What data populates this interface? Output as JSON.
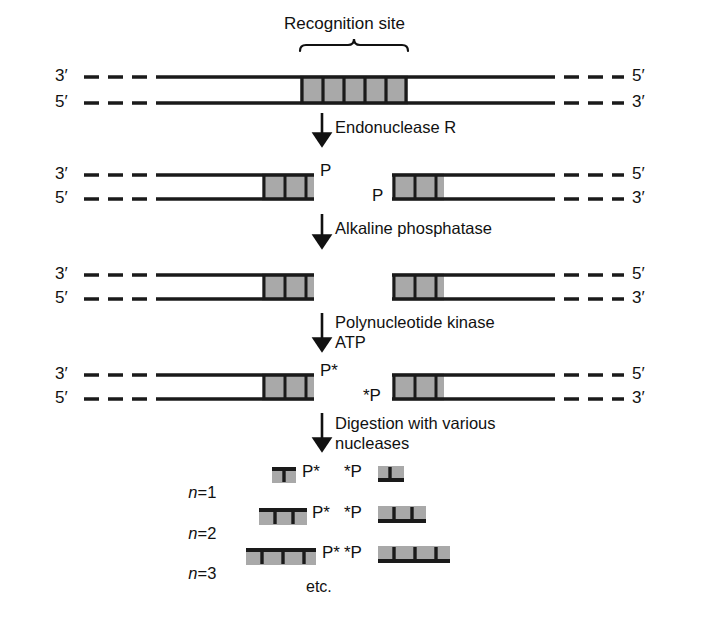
{
  "figure": {
    "title": "Recognition site",
    "bottom_note": "etc.",
    "colors": {
      "ink": "#111111",
      "strand": "#1a1a1a",
      "site_fill": "#a9a9a9",
      "background": "#ffffff"
    }
  },
  "steps": [
    {
      "id": "step-endonuclease",
      "lines": [
        "Endonuclease R"
      ]
    },
    {
      "id": "step-phosphatase",
      "lines": [
        "Alkaline phosphatase"
      ]
    },
    {
      "id": "step-kinase",
      "lines": [
        "Polynucleotide kinase",
        "ATP"
      ]
    },
    {
      "id": "step-digestion",
      "lines": [
        "Digestion with various",
        "nucleases"
      ]
    }
  ],
  "step_labels": {
    "endonuclease": "Endonuclease R",
    "phosphatase": "Alkaline phosphatase",
    "kinase_line1": "Polynucleotide kinase",
    "kinase_line2": "ATP",
    "digestion_line1": "Digestion with various",
    "digestion_line2": "nucleases"
  },
  "rows": {
    "duplex": {
      "name": "intact-duplex",
      "left_top": "3′",
      "left_bottom": "5′",
      "right_top": "5′",
      "right_bottom": "3′"
    },
    "cleaved": {
      "name": "cleaved-fragments",
      "left_top": "3′",
      "left_bottom": "5′",
      "right_top": "5′",
      "right_bottom": "3′",
      "left_phosphate": "P",
      "right_phosphate": "P"
    },
    "dephosphorylated": {
      "name": "dephosphorylated-fragments",
      "left_top": "3′",
      "left_bottom": "5′",
      "right_top": "5′",
      "right_bottom": "3′"
    },
    "labeled": {
      "name": "radiolabeled-fragments",
      "left_top": "3′",
      "left_bottom": "5′",
      "right_top": "5′",
      "right_bottom": "3′",
      "left_phosphate": "P*",
      "right_phosphate": "*P"
    }
  },
  "digests": [
    {
      "label_n": "n",
      "label_eq": "=",
      "label_val": "1",
      "left_phosphate": "P*",
      "right_phosphate": "*P",
      "ticks": 1
    },
    {
      "label_n": "n",
      "label_eq": "=",
      "label_val": "2",
      "left_phosphate": "P*",
      "right_phosphate": "*P",
      "ticks": 2
    },
    {
      "label_n": "n",
      "label_eq": "=",
      "label_val": "3",
      "left_phosphate": "P*",
      "right_phosphate": "*P",
      "ticks": 3
    }
  ]
}
